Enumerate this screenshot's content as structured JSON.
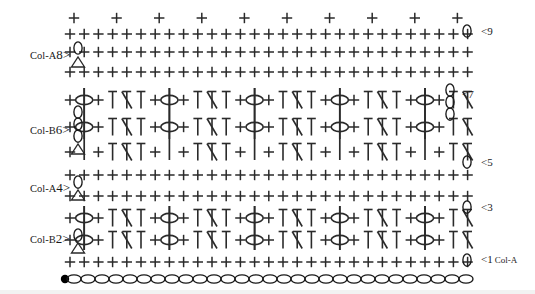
{
  "canvas": {
    "width": 535,
    "height": 294,
    "background": "#ffffff",
    "ink": "#2a2a2a"
  },
  "colors": {
    "stitch_ink": "#2a2a2a",
    "chain_outline": "#1a1a1a",
    "slipknot_fill": "#000000",
    "text": "#1a1a1a"
  },
  "left_labels": [
    {
      "color_label": "Col-A",
      "row_number": "8",
      "arrow": ">",
      "turning_chain": "1-chain-plus-triangle"
    },
    {
      "color_label": "Col-B",
      "row_number": "6",
      "arrow": ">",
      "turning_chain": "3-chain-plus-triangle"
    },
    {
      "color_label": "Col-A",
      "row_number": "4",
      "arrow": ">",
      "turning_chain": "1-chain-plus-triangle"
    },
    {
      "color_label": "Col-B",
      "row_number": "2",
      "arrow": ">",
      "turning_chain": "1-chain-plus-triangle"
    }
  ],
  "right_labels": [
    {
      "row_number": "9",
      "arrow": "<",
      "turning_chain": "1-chain",
      "color_label": ""
    },
    {
      "row_number": "7",
      "arrow": "<",
      "turning_chain": "3-chain",
      "color_label": ""
    },
    {
      "row_number": "5",
      "arrow": "<",
      "turning_chain": "1-chain",
      "color_label": ""
    },
    {
      "row_number": "3",
      "arrow": "<",
      "turning_chain": "1-chain",
      "color_label": ""
    },
    {
      "row_number": "1",
      "arrow": "<",
      "turning_chain": "1-chain",
      "color_label": "Col-A"
    }
  ],
  "legend_symbols": [
    {
      "name": "chain-stitch",
      "glyph": "oval",
      "meaning": "chain"
    },
    {
      "name": "slip-knot",
      "glyph": "filled-dot",
      "meaning": "slip knot / start"
    },
    {
      "name": "single-crochet",
      "glyph": "plus",
      "meaning": "single crochet"
    },
    {
      "name": "half-double-crochet",
      "glyph": "T-bar",
      "meaning": "half double crochet"
    },
    {
      "name": "crossed-stitch",
      "glyph": "diagonal-slash",
      "meaning": "crossed / spike stitch"
    },
    {
      "name": "bobble-stitch",
      "glyph": "long-bar-with-oval",
      "meaning": "bobble worked into lower row"
    },
    {
      "name": "turning-chain-triangle",
      "glyph": "triangle",
      "meaning": "turning chain marker"
    }
  ],
  "foundation_chain": {
    "count": 29,
    "has_slip_knot": true
  },
  "chart_data": {
    "type": "table",
    "rows": [
      {
        "row": 9,
        "side": "right",
        "color": "Col-A",
        "stitches": "single crochet across"
      },
      {
        "row": 8,
        "side": "left",
        "color": "Col-A",
        "stitches": "single crochet across"
      },
      {
        "row": 7,
        "side": "right",
        "color": "Col-B",
        "stitches": "half double crochet with crossed stitches"
      },
      {
        "row": 6,
        "side": "left",
        "color": "Col-B",
        "stitches": "single crochet with bobble clusters"
      },
      {
        "row": 5,
        "side": "right",
        "color": "Col-A",
        "stitches": "single crochet across"
      },
      {
        "row": 4,
        "side": "left",
        "color": "Col-A",
        "stitches": "half double crochet with crossed stitches"
      },
      {
        "row": 3,
        "side": "right",
        "color": "Col-B",
        "stitches": "single crochet with bobble clusters"
      },
      {
        "row": 2,
        "side": "left",
        "color": "Col-B",
        "stitches": "half double crochet with crossed stitches"
      },
      {
        "row": 1,
        "side": "right",
        "color": "Col-A",
        "stitches": "single crochet across"
      },
      {
        "row": 0,
        "side": "base",
        "color": "Col-A",
        "stitches": "foundation chain"
      }
    ]
  }
}
